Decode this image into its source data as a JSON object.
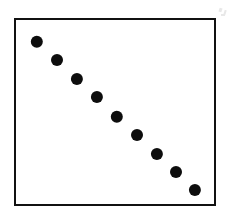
{
  "figure": {
    "width": 231,
    "height": 219,
    "background_color": "#ffffff",
    "frame_color": "#111111",
    "point_color": "#0d0d0d"
  },
  "chart_data": {
    "type": "scatter",
    "title": "",
    "subtitle": "",
    "xlabel": "",
    "ylabel": "",
    "legend": [],
    "annotations": [],
    "grid": false,
    "xticks": [],
    "yticks": [],
    "xticklabels": [],
    "yticklabels": [],
    "xlim": [
      0,
      10
    ],
    "ylim": [
      0,
      10
    ],
    "relationship": "perfect negative linear correlation",
    "correlation": -1.0,
    "n_points": 9,
    "marker": "filled-circle",
    "marker_size_px": 12,
    "x": [
      1,
      2,
      3,
      4,
      5,
      6,
      7,
      8,
      9
    ],
    "y": [
      9,
      8,
      7,
      6,
      5,
      4,
      3,
      2,
      1
    ],
    "points_px": [
      {
        "cx": 21,
        "cy": 22,
        "r": 6.2
      },
      {
        "cx": 41,
        "cy": 40,
        "r": 6.0
      },
      {
        "cx": 61,
        "cy": 59,
        "r": 6.1
      },
      {
        "cx": 81,
        "cy": 77,
        "r": 6.1
      },
      {
        "cx": 101,
        "cy": 97,
        "r": 6.2
      },
      {
        "cx": 121,
        "cy": 115,
        "r": 6.0
      },
      {
        "cx": 141,
        "cy": 134,
        "r": 6.1
      },
      {
        "cx": 160,
        "cy": 152,
        "r": 6.0
      },
      {
        "cx": 179,
        "cy": 170,
        "r": 6.1
      }
    ]
  }
}
